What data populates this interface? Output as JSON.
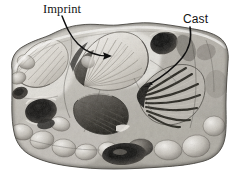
{
  "figure": {
    "kind": "photograph-with-annotations",
    "width_px": 232,
    "height_px": 177,
    "background_color": "#ffffff"
  },
  "annotations": [
    {
      "id": "imprint",
      "label": "Imprint",
      "typeface_style": "serif",
      "text_color": "#141414",
      "x_px": 43,
      "y_px": 3,
      "leader": {
        "name": "imprint-leader-arrow",
        "color": "#101010",
        "start_x": 62,
        "start_y": 17,
        "end_x": 110,
        "end_y": 56,
        "arrowhead": "right"
      }
    },
    {
      "id": "cast",
      "label": "Cast",
      "typeface_style": "sans-serif",
      "text_color": "#141414",
      "x_px": 183,
      "y_px": 13,
      "leader": {
        "name": "cast-leader-arrow",
        "color": "#101010",
        "start_x": 190,
        "start_y": 28,
        "end_x": 144,
        "end_y": 86,
        "arrowhead": "left"
      }
    }
  ],
  "specimen": {
    "name": "rock-slab",
    "palette": {
      "highlight": "#f2f0ec",
      "light": "#d8d5cf",
      "mid": "#a8a49c",
      "shade": "#6e6a63",
      "dark": "#2e2c29",
      "deepest": "#121110",
      "outline": "#3a3835"
    },
    "features": [
      {
        "name": "fossil-shell-imprint",
        "type": "fan-shell-imprint",
        "cx": 118,
        "cy": 62
      },
      {
        "name": "fossil-shell-cast",
        "type": "fan-shell-cast",
        "cx": 168,
        "cy": 96
      },
      {
        "name": "fossil-shell-lower-center",
        "type": "fan-shell-dark",
        "cx": 103,
        "cy": 108
      },
      {
        "name": "fossil-shell-left",
        "type": "fan-shell-light",
        "cx": 38,
        "cy": 62
      },
      {
        "name": "cavity-upper-right",
        "type": "dark-cavity",
        "cx": 164,
        "cy": 42
      },
      {
        "name": "cavity-left",
        "type": "dark-cavity",
        "cx": 41,
        "cy": 111
      },
      {
        "name": "cavity-bottom-center",
        "type": "dark-cavity",
        "cx": 122,
        "cy": 152
      },
      {
        "name": "matrix-nodules",
        "type": "pebble-cluster",
        "cx": 116,
        "cy": 150
      }
    ]
  }
}
